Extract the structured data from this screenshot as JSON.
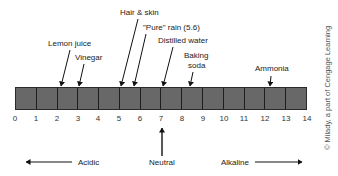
{
  "scale": {
    "min": 0,
    "max": 14,
    "ticks": [
      "0",
      "1",
      "2",
      "3",
      "4",
      "5",
      "6",
      "7",
      "8",
      "9",
      "10",
      "11",
      "12",
      "13",
      "14"
    ],
    "bar_color": "#686868",
    "cell_border_color": "#1e1e1e"
  },
  "markers": [
    {
      "label": "Lemon juice",
      "ph": 2.2
    },
    {
      "label": "Vinegar",
      "ph": 3.0
    },
    {
      "label": "Hair & skin",
      "ph": 5.0
    },
    {
      "label": "\"Pure\" rain (5.6)",
      "ph": 5.6
    },
    {
      "label": "Distilled water",
      "ph": 7.0
    },
    {
      "label": "Baking",
      "label_line2": "soda",
      "ph": 8.3
    },
    {
      "label": "Ammonia",
      "ph": 12.0
    }
  ],
  "neutral": {
    "label": "Neutral",
    "ph": 7
  },
  "acidic": {
    "label": "Acidic"
  },
  "alkaline": {
    "label": "Alkaline"
  },
  "credit": "© Milady, a part of Cengage Learning"
}
